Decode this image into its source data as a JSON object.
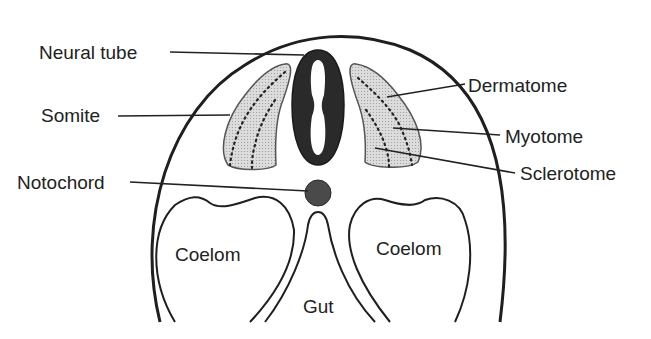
{
  "diagram": {
    "colors": {
      "background": "#ffffff",
      "outline": "#1f1f1f",
      "neural_tube": "#2a2a2a",
      "notochord": "#4a4a4a",
      "somite_fill": "#d6d6d6",
      "text": "#222222"
    },
    "labels": {
      "neural_tube": "Neural tube",
      "somite": "Somite",
      "notochord": "Notochord",
      "dermatome": "Dermatome",
      "myotome": "Myotome",
      "sclerotome": "Sclerotome",
      "coelom_left": "Coelom",
      "coelom_right": "Coelom",
      "gut": "Gut"
    }
  }
}
